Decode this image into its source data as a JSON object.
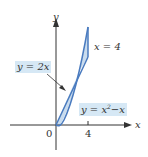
{
  "diagram": {
    "axes": {
      "x_label": "x",
      "y_label": "y",
      "origin_label": "0",
      "x_tick_label": "4"
    },
    "labels": {
      "line": "y = 2x",
      "parabola_prefix": "y = x",
      "parabola_exp": "2",
      "parabola_suffix": "−x",
      "vertical_line": "x = 4"
    },
    "colors": {
      "curve": "#4a7bbf",
      "fill": "#c9dcee",
      "label_bg": "#d6e8f5",
      "axis": "#333333"
    }
  }
}
